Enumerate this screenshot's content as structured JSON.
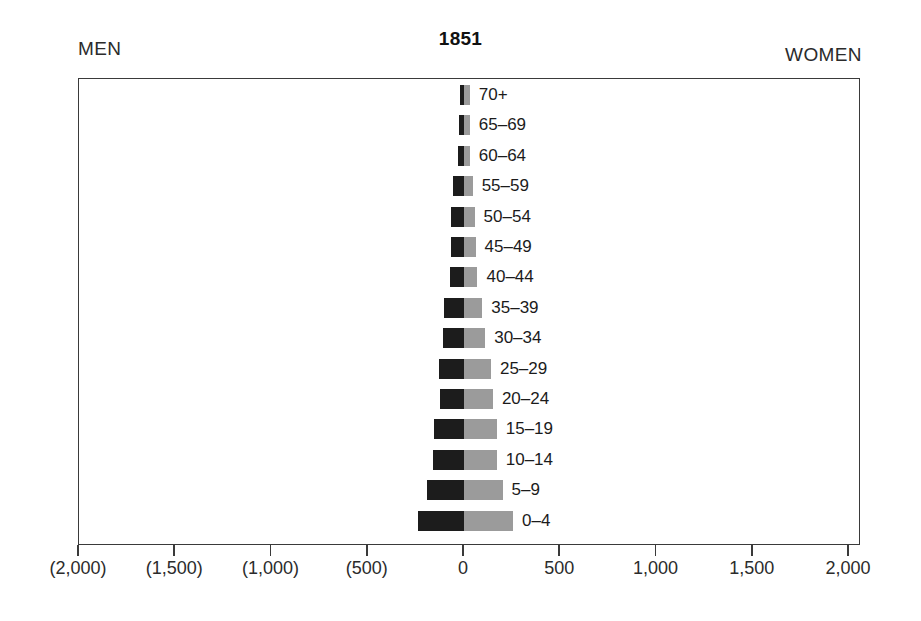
{
  "header": {
    "men_label": "MEN",
    "women_label": "WOMEN",
    "title": "1851"
  },
  "chart_data": {
    "type": "bar",
    "subtype": "population-pyramid",
    "title": "1851",
    "xlabel": "",
    "ylabel": "",
    "left_series_name": "MEN",
    "right_series_name": "WOMEN",
    "xlim": [
      -2000,
      2000
    ],
    "grid": false,
    "legend_position": "top-corners",
    "axis_tick_values": [
      -2000,
      -1500,
      -1000,
      -500,
      0,
      500,
      1000,
      1500,
      2000
    ],
    "axis_tick_labels": [
      "(2,000)",
      "(1,500)",
      "(1,000)",
      "(500)",
      "0",
      "500",
      "1,000",
      "1,500",
      "2,000"
    ],
    "categories": [
      "70+",
      "65–69",
      "60–64",
      "55–59",
      "50–54",
      "45–49",
      "40–44",
      "35–39",
      "30–34",
      "25–29",
      "20–24",
      "15–19",
      "10–14",
      "5–9",
      "0–4"
    ],
    "series": [
      {
        "name": "MEN",
        "side": "left",
        "color": "#1c1c1c",
        "values": [
          20,
          25,
          30,
          55,
          65,
          65,
          75,
          105,
          110,
          130,
          125,
          155,
          160,
          190,
          240
        ]
      },
      {
        "name": "WOMEN",
        "side": "right",
        "color": "#9b9b9b",
        "values": [
          30,
          30,
          30,
          45,
          55,
          60,
          70,
          95,
          110,
          140,
          150,
          170,
          170,
          200,
          255
        ]
      }
    ]
  },
  "colors": {
    "men_bar": "#1c1c1c",
    "women_bar": "#9b9b9b",
    "frame": "#3a3a3a",
    "text": "#1b1b1b",
    "background": "#ffffff"
  }
}
